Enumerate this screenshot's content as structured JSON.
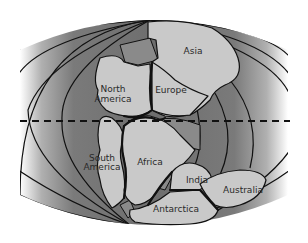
{
  "map": {
    "title": "Pangaea / Gondwanaland continental reconstruction",
    "labels": {
      "asia": "Asia",
      "europe": "Europe",
      "north_america": "North America",
      "north_america_line1": "North",
      "north_america_line2": "America",
      "south_america_line1": "South",
      "south_america_line2": "America",
      "africa": "Africa",
      "india": "India",
      "australia": "Australia",
      "antarctica": "Antarctica"
    },
    "features": {
      "equator": "dashed-line",
      "ocean": "panthalassa-shaded",
      "meridians": "curved-lines"
    },
    "colors": {
      "land": "#c9c9c9",
      "shelf": "#8a8a8a",
      "ocean_dark": "#6e6e6e",
      "ocean_light": "#ffffff",
      "outline": "#111111"
    }
  }
}
